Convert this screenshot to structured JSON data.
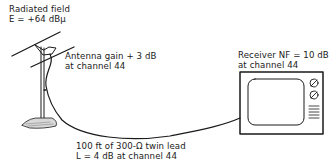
{
  "diagram": {
    "radiated_field": {
      "line1": "Radiated field",
      "line2": "E = +64 dBμ"
    },
    "antenna": {
      "line1": "Antenna gain + 3 dB",
      "line2": "at channel 44"
    },
    "feedline": {
      "line1": "100 ft of 300-Ω twin lead",
      "line2": "L = 4 dB at channel 44"
    },
    "receiver": {
      "line1": "Receiver NF = 10 dB",
      "line2": "at channel 44"
    },
    "components": [
      "antenna-icon",
      "twin-lead-cable",
      "television-receiver-icon"
    ],
    "colors": {
      "line": "#1a1a1a",
      "background": "#ffffff"
    }
  }
}
